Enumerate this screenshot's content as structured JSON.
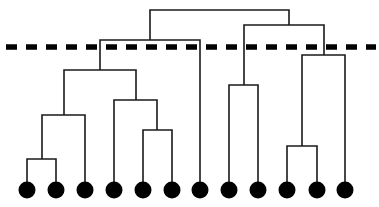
{
  "diagram": {
    "type": "dendrogram",
    "colors": {
      "line": "#1a1a1a",
      "leaf": "#000000",
      "cut_line": "#000000",
      "background": "#ffffff"
    },
    "leaf_y": 190,
    "leaf_radius": 8.5,
    "leaves": [
      {
        "id": "leaf-1",
        "x": 27
      },
      {
        "id": "leaf-2",
        "x": 56
      },
      {
        "id": "leaf-3",
        "x": 85
      },
      {
        "id": "leaf-4",
        "x": 114
      },
      {
        "id": "leaf-5",
        "x": 143
      },
      {
        "id": "leaf-6",
        "x": 172
      },
      {
        "id": "leaf-7",
        "x": 200
      },
      {
        "id": "leaf-8",
        "x": 229
      },
      {
        "id": "leaf-9",
        "x": 258
      },
      {
        "id": "leaf-10",
        "x": 287
      },
      {
        "id": "leaf-11",
        "x": 317
      },
      {
        "id": "leaf-12",
        "x": 345
      }
    ],
    "merges": [
      {
        "id": "m-1-2",
        "left_x": 27,
        "left_y": 190,
        "right_x": 56,
        "right_y": 190,
        "y": 159
      },
      {
        "id": "m-12-3",
        "left_x": 42,
        "left_y": 159,
        "right_x": 85,
        "right_y": 190,
        "y": 115
      },
      {
        "id": "m-5-6",
        "left_x": 143,
        "left_y": 190,
        "right_x": 172,
        "right_y": 190,
        "y": 130
      },
      {
        "id": "m-4-56",
        "left_x": 114,
        "left_y": 190,
        "right_x": 157,
        "right_y": 130,
        "y": 100
      },
      {
        "id": "m-123-456",
        "left_x": 64,
        "left_y": 115,
        "right_x": 136,
        "right_y": 100,
        "y": 70
      },
      {
        "id": "m-left-7",
        "left_x": 100,
        "left_y": 70,
        "right_x": 200,
        "right_y": 190,
        "y": 40
      },
      {
        "id": "m-8-9",
        "left_x": 229,
        "left_y": 190,
        "right_x": 258,
        "right_y": 190,
        "y": 85
      },
      {
        "id": "m-10-11",
        "left_x": 287,
        "left_y": 190,
        "right_x": 317,
        "right_y": 190,
        "y": 146
      },
      {
        "id": "m-1011-12",
        "left_x": 302,
        "left_y": 146,
        "right_x": 345,
        "right_y": 190,
        "y": 55
      },
      {
        "id": "m-89-right",
        "left_x": 244,
        "left_y": 85,
        "right_x": 324,
        "right_y": 55,
        "y": 25
      },
      {
        "id": "m-root",
        "left_x": 150,
        "left_y": 40,
        "right_x": 289,
        "right_y": 25,
        "y": 10
      }
    ],
    "cut_line": {
      "x1": 6,
      "x2": 376,
      "y": 47,
      "dash": 11,
      "gap": 9,
      "thickness": 5.5
    }
  }
}
